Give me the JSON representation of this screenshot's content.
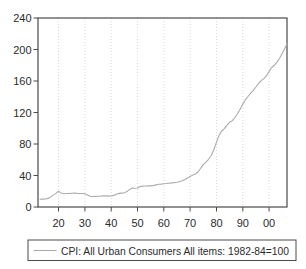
{
  "figure": {
    "width": 306,
    "height": 269
  },
  "colors": {
    "background": "#ffffff",
    "axis": "#4a4a4a",
    "grid": "#dadada",
    "series_line": "#ababab",
    "text": "#2b2b2b",
    "legend_border": "#4a4a4a"
  },
  "chart_data": {
    "type": "line",
    "title": "",
    "xlabel": "",
    "ylabel": "",
    "xlim": [
      1912.2,
      2006.8
    ],
    "ylim": [
      0,
      240
    ],
    "grid": "vertical-dotted",
    "x_ticks": [
      {
        "value": 1920,
        "label": "20"
      },
      {
        "value": 1930,
        "label": "30"
      },
      {
        "value": 1940,
        "label": "40"
      },
      {
        "value": 1950,
        "label": "50"
      },
      {
        "value": 1960,
        "label": "60"
      },
      {
        "value": 1970,
        "label": "70"
      },
      {
        "value": 1980,
        "label": "80"
      },
      {
        "value": 1990,
        "label": "90"
      },
      {
        "value": 2000,
        "label": "00"
      }
    ],
    "y_ticks": [
      {
        "value": 0,
        "label": "0"
      },
      {
        "value": 40,
        "label": "40"
      },
      {
        "value": 80,
        "label": "80"
      },
      {
        "value": 120,
        "label": "120"
      },
      {
        "value": 160,
        "label": "160"
      },
      {
        "value": 200,
        "label": "200"
      },
      {
        "value": 240,
        "label": "240"
      }
    ],
    "legend": {
      "position": "bottom",
      "label": "CPI: All Urban Consumers  All items: 1982-84=100"
    },
    "series": [
      {
        "name": "CPI: All Urban Consumers  All items: 1982-84=100",
        "x": [
          1913,
          1914,
          1915,
          1916,
          1917,
          1918,
          1919,
          1920,
          1921,
          1922,
          1923,
          1924,
          1925,
          1926,
          1927,
          1928,
          1929,
          1930,
          1931,
          1932,
          1933,
          1934,
          1935,
          1936,
          1937,
          1938,
          1939,
          1940,
          1941,
          1942,
          1943,
          1944,
          1945,
          1946,
          1947,
          1948,
          1949,
          1950,
          1951,
          1952,
          1953,
          1954,
          1955,
          1956,
          1957,
          1958,
          1959,
          1960,
          1961,
          1962,
          1963,
          1964,
          1965,
          1966,
          1967,
          1968,
          1969,
          1970,
          1971,
          1972,
          1973,
          1974,
          1975,
          1976,
          1977,
          1978,
          1979,
          1980,
          1981,
          1982,
          1983,
          1984,
          1985,
          1986,
          1987,
          1988,
          1989,
          1990,
          1991,
          1992,
          1993,
          1994,
          1995,
          1996,
          1997,
          1998,
          1999,
          2000,
          2001,
          2002,
          2003,
          2004,
          2005,
          2006,
          2007
        ],
        "values": [
          9.9,
          10.0,
          10.1,
          10.9,
          12.8,
          15.1,
          17.3,
          20.0,
          17.9,
          16.8,
          17.1,
          17.1,
          17.5,
          17.7,
          17.4,
          17.1,
          17.1,
          16.7,
          15.2,
          13.7,
          13.0,
          13.4,
          13.7,
          13.9,
          14.4,
          14.1,
          13.9,
          14.0,
          14.7,
          16.3,
          17.3,
          17.6,
          18.0,
          19.5,
          22.3,
          24.1,
          23.8,
          24.1,
          26.0,
          26.5,
          26.7,
          26.9,
          26.8,
          27.2,
          28.1,
          28.9,
          29.1,
          29.6,
          29.9,
          30.2,
          30.6,
          31.0,
          31.5,
          32.4,
          33.4,
          34.8,
          36.7,
          38.8,
          40.5,
          41.8,
          44.4,
          49.3,
          53.8,
          56.9,
          60.6,
          65.2,
          72.6,
          82.4,
          90.9,
          96.5,
          99.6,
          103.9,
          107.6,
          109.6,
          113.6,
          118.3,
          124.0,
          130.7,
          136.2,
          140.3,
          144.5,
          148.2,
          152.4,
          156.9,
          160.5,
          163.0,
          166.6,
          172.2,
          177.1,
          179.9,
          184.0,
          188.9,
          195.3,
          201.6,
          207.3
        ]
      }
    ]
  }
}
